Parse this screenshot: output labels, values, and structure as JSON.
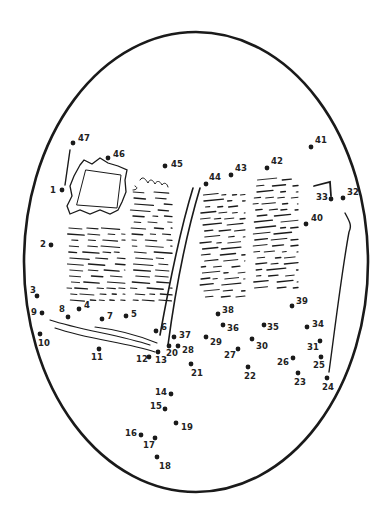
{
  "puzzle": {
    "type": "connect-the-dots",
    "subject": "open-book",
    "colors": {
      "ink": "#1a1a1a",
      "background": "#ffffff"
    },
    "frame": {
      "shape": "oval",
      "cx": 196,
      "cy": 262,
      "rx": 172,
      "ry": 230
    },
    "dots": [
      {
        "n": "1",
        "x": 62,
        "y": 190,
        "lx": -12,
        "ly": -4
      },
      {
        "n": "2",
        "x": 51,
        "y": 245,
        "lx": -11,
        "ly": -5
      },
      {
        "n": "3",
        "x": 37,
        "y": 296,
        "lx": -7,
        "ly": -10
      },
      {
        "n": "4",
        "x": 79,
        "y": 309,
        "lx": 5,
        "ly": -8
      },
      {
        "n": "5",
        "x": 126,
        "y": 316,
        "lx": 5,
        "ly": -6
      },
      {
        "n": "6",
        "x": 156,
        "y": 331,
        "lx": 5,
        "ly": -8
      },
      {
        "n": "7",
        "x": 102,
        "y": 319,
        "lx": 5,
        "ly": -7
      },
      {
        "n": "8",
        "x": 68,
        "y": 317,
        "lx": -9,
        "ly": -12
      },
      {
        "n": "9",
        "x": 42,
        "y": 313,
        "lx": -11,
        "ly": -5
      },
      {
        "n": "10",
        "x": 40,
        "y": 334,
        "lx": -2,
        "ly": 5
      },
      {
        "n": "11",
        "x": 99,
        "y": 349,
        "lx": -8,
        "ly": 4
      },
      {
        "n": "12",
        "x": 149,
        "y": 357,
        "lx": -13,
        "ly": -2
      },
      {
        "n": "13",
        "x": 158,
        "y": 352,
        "lx": -3,
        "ly": 4
      },
      {
        "n": "14",
        "x": 171,
        "y": 394,
        "lx": -16,
        "ly": -6
      },
      {
        "n": "15",
        "x": 165,
        "y": 409,
        "lx": -15,
        "ly": -7
      },
      {
        "n": "16",
        "x": 141,
        "y": 435,
        "lx": -16,
        "ly": -6
      },
      {
        "n": "17",
        "x": 155,
        "y": 438,
        "lx": -12,
        "ly": 3
      },
      {
        "n": "18",
        "x": 157,
        "y": 457,
        "lx": 2,
        "ly": 5
      },
      {
        "n": "19",
        "x": 176,
        "y": 423,
        "lx": 5,
        "ly": 0
      },
      {
        "n": "20",
        "x": 169,
        "y": 346,
        "lx": -3,
        "ly": 3
      },
      {
        "n": "21",
        "x": 191,
        "y": 364,
        "lx": 0,
        "ly": 5
      },
      {
        "n": "22",
        "x": 248,
        "y": 367,
        "lx": -4,
        "ly": 5
      },
      {
        "n": "23",
        "x": 298,
        "y": 373,
        "lx": -4,
        "ly": 5
      },
      {
        "n": "24",
        "x": 327,
        "y": 378,
        "lx": -5,
        "ly": 5
      },
      {
        "n": "25",
        "x": 321,
        "y": 357,
        "lx": -8,
        "ly": 4
      },
      {
        "n": "26",
        "x": 293,
        "y": 358,
        "lx": -16,
        "ly": 0
      },
      {
        "n": "27",
        "x": 238,
        "y": 349,
        "lx": -14,
        "ly": 2
      },
      {
        "n": "28",
        "x": 178,
        "y": 346,
        "lx": 4,
        "ly": 0
      },
      {
        "n": "29",
        "x": 206,
        "y": 337,
        "lx": 4,
        "ly": 1
      },
      {
        "n": "30",
        "x": 252,
        "y": 339,
        "lx": 4,
        "ly": 3
      },
      {
        "n": "31",
        "x": 320,
        "y": 341,
        "lx": -13,
        "ly": 2
      },
      {
        "n": "32",
        "x": 343,
        "y": 198,
        "lx": 4,
        "ly": -10
      },
      {
        "n": "33",
        "x": 331,
        "y": 199,
        "lx": -15,
        "ly": -6
      },
      {
        "n": "34",
        "x": 307,
        "y": 327,
        "lx": 5,
        "ly": -7
      },
      {
        "n": "35",
        "x": 264,
        "y": 325,
        "lx": 3,
        "ly": -2
      },
      {
        "n": "36",
        "x": 223,
        "y": 325,
        "lx": 4,
        "ly": -1
      },
      {
        "n": "37",
        "x": 174,
        "y": 337,
        "lx": 5,
        "ly": -6
      },
      {
        "n": "38",
        "x": 218,
        "y": 314,
        "lx": 4,
        "ly": -8
      },
      {
        "n": "39",
        "x": 292,
        "y": 306,
        "lx": 4,
        "ly": -9
      },
      {
        "n": "40",
        "x": 306,
        "y": 224,
        "lx": 5,
        "ly": -10
      },
      {
        "n": "41",
        "x": 311,
        "y": 147,
        "lx": 4,
        "ly": -11
      },
      {
        "n": "42",
        "x": 267,
        "y": 168,
        "lx": 4,
        "ly": -11
      },
      {
        "n": "43",
        "x": 231,
        "y": 175,
        "lx": 4,
        "ly": -11
      },
      {
        "n": "44",
        "x": 206,
        "y": 184,
        "lx": 3,
        "ly": -11
      },
      {
        "n": "45",
        "x": 165,
        "y": 166,
        "lx": 6,
        "ly": -6
      },
      {
        "n": "46",
        "x": 108,
        "y": 158,
        "lx": 5,
        "ly": -8
      },
      {
        "n": "47",
        "x": 73,
        "y": 143,
        "lx": 5,
        "ly": -9
      }
    ]
  }
}
